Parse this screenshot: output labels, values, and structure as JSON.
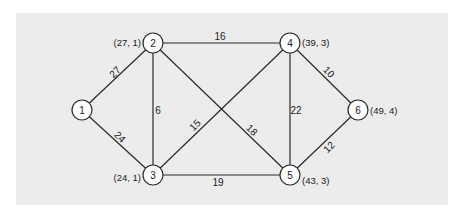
{
  "diagram": {
    "type": "weighted-undirected-graph",
    "background_color": "#ececec",
    "nodes": [
      {
        "id": "1",
        "label": "1",
        "x": 82,
        "y": 110,
        "coord": "",
        "coord_x": 0,
        "coord_y": 0,
        "coord_anchor": "start"
      },
      {
        "id": "2",
        "label": "2",
        "x": 153,
        "y": 43,
        "coord": "(27, 1)",
        "coord_x": 141,
        "coord_y": 42,
        "coord_anchor": "end"
      },
      {
        "id": "3",
        "label": "3",
        "x": 153,
        "y": 175,
        "coord": "(24, 1)",
        "coord_x": 141,
        "coord_y": 177,
        "coord_anchor": "end"
      },
      {
        "id": "4",
        "label": "4",
        "x": 290,
        "y": 43,
        "coord": "(39, 3)",
        "coord_x": 302,
        "coord_y": 42,
        "coord_anchor": "start"
      },
      {
        "id": "5",
        "label": "5",
        "x": 290,
        "y": 175,
        "coord": "(43, 3)",
        "coord_x": 302,
        "coord_y": 180,
        "coord_anchor": "start"
      },
      {
        "id": "6",
        "label": "6",
        "x": 358,
        "y": 110,
        "coord": "(49, 4)",
        "coord_x": 370,
        "coord_y": 110,
        "coord_anchor": "start"
      }
    ],
    "edges": [
      {
        "from": "1",
        "to": "2",
        "weight": "27",
        "lx": 115,
        "ly": 72,
        "rot": -45
      },
      {
        "from": "1",
        "to": "3",
        "weight": "24",
        "lx": 120,
        "ly": 137,
        "rot": 45
      },
      {
        "from": "2",
        "to": "3",
        "weight": "6",
        "lx": 158,
        "ly": 110,
        "rot": 0
      },
      {
        "from": "2",
        "to": "4",
        "weight": "16",
        "lx": 220,
        "ly": 36,
        "rot": 0
      },
      {
        "from": "2",
        "to": "5",
        "weight": "18",
        "lx": 252,
        "ly": 130,
        "rot": 45
      },
      {
        "from": "3",
        "to": "4",
        "weight": "15",
        "lx": 195,
        "ly": 125,
        "rot": -45
      },
      {
        "from": "3",
        "to": "5",
        "weight": "19",
        "lx": 218,
        "ly": 182,
        "rot": 0
      },
      {
        "from": "4",
        "to": "5",
        "weight": "22",
        "lx": 296,
        "ly": 110,
        "rot": 0
      },
      {
        "from": "4",
        "to": "6",
        "weight": "10",
        "lx": 329,
        "ly": 72,
        "rot": 45
      },
      {
        "from": "5",
        "to": "6",
        "weight": "12",
        "lx": 329,
        "ly": 147,
        "rot": -45
      }
    ]
  }
}
